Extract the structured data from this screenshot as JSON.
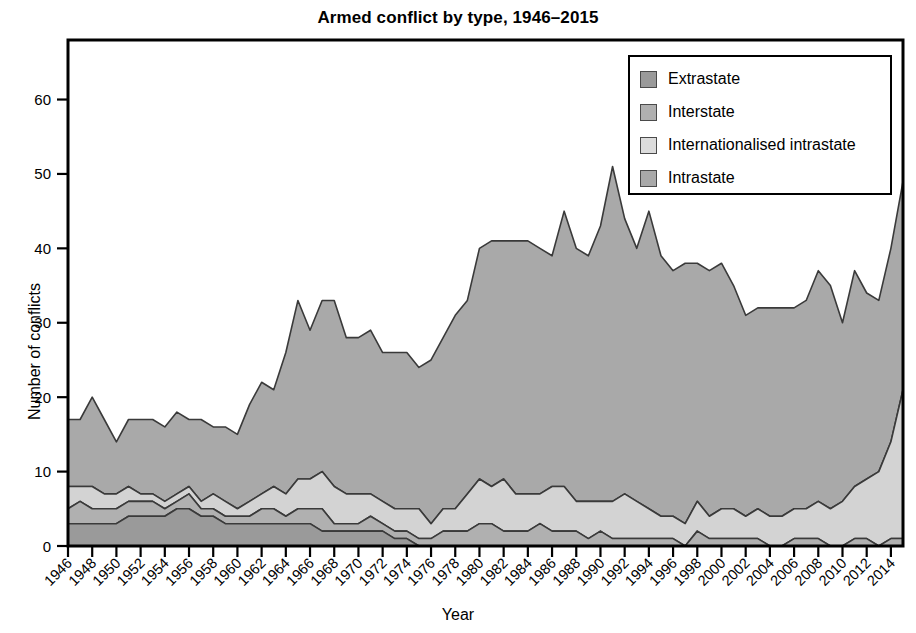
{
  "chart_data": {
    "type": "area",
    "stacked": true,
    "title": "Armed conflict by type, 1946–2015",
    "xlabel": "Year",
    "ylabel": "Number of conflicts",
    "xlim": [
      1946,
      2015
    ],
    "ylim": [
      0,
      68
    ],
    "yticks": [
      0,
      10,
      20,
      30,
      40,
      50,
      60
    ],
    "xticks": [
      1946,
      1948,
      1950,
      1952,
      1954,
      1956,
      1958,
      1960,
      1962,
      1964,
      1966,
      1968,
      1970,
      1972,
      1974,
      1976,
      1978,
      1980,
      1982,
      1984,
      1986,
      1988,
      1990,
      1992,
      1994,
      1996,
      1998,
      2000,
      2002,
      2004,
      2006,
      2008,
      2010,
      2012,
      2014
    ],
    "grid": false,
    "legend_position": "top-right",
    "x": [
      1946,
      1947,
      1948,
      1949,
      1950,
      1951,
      1952,
      1953,
      1954,
      1955,
      1956,
      1957,
      1958,
      1959,
      1960,
      1961,
      1962,
      1963,
      1964,
      1965,
      1966,
      1967,
      1968,
      1969,
      1970,
      1971,
      1972,
      1973,
      1974,
      1975,
      1976,
      1977,
      1978,
      1979,
      1980,
      1981,
      1982,
      1983,
      1984,
      1985,
      1986,
      1987,
      1988,
      1989,
      1990,
      1991,
      1992,
      1993,
      1994,
      1995,
      1996,
      1997,
      1998,
      1999,
      2000,
      2001,
      2002,
      2003,
      2004,
      2005,
      2006,
      2007,
      2008,
      2009,
      2010,
      2011,
      2012,
      2013,
      2014,
      2015
    ],
    "series": [
      {
        "name": "Extrastate",
        "color": "#9a9a9a",
        "values": [
          3,
          3,
          3,
          3,
          3,
          4,
          4,
          4,
          4,
          5,
          5,
          4,
          4,
          3,
          3,
          3,
          3,
          3,
          3,
          3,
          3,
          2,
          2,
          2,
          2,
          2,
          2,
          1,
          1,
          0,
          0,
          0,
          0,
          0,
          0,
          0,
          0,
          0,
          0,
          0,
          0,
          0,
          0,
          0,
          0,
          0,
          0,
          0,
          0,
          0,
          0,
          0,
          0,
          0,
          0,
          0,
          0,
          0,
          0,
          0,
          0,
          0,
          0,
          0,
          0,
          0,
          0,
          0,
          0,
          0
        ]
      },
      {
        "name": "Interstate",
        "color": "#b0b0b0",
        "values": [
          2,
          3,
          2,
          2,
          2,
          2,
          2,
          2,
          1,
          1,
          2,
          1,
          1,
          1,
          1,
          1,
          2,
          2,
          1,
          2,
          2,
          3,
          1,
          1,
          1,
          2,
          1,
          1,
          1,
          1,
          1,
          2,
          2,
          2,
          3,
          3,
          2,
          2,
          2,
          3,
          2,
          2,
          2,
          1,
          2,
          1,
          1,
          1,
          1,
          1,
          1,
          0,
          2,
          1,
          1,
          1,
          1,
          1,
          0,
          0,
          1,
          1,
          1,
          0,
          0,
          1,
          1,
          0,
          1,
          1
        ]
      },
      {
        "name": "Internationalised intrastate",
        "color": "#d3d3d3",
        "values": [
          3,
          2,
          3,
          2,
          2,
          2,
          1,
          1,
          1,
          1,
          1,
          1,
          2,
          2,
          1,
          2,
          2,
          3,
          3,
          4,
          4,
          5,
          5,
          4,
          4,
          3,
          3,
          3,
          3,
          4,
          2,
          3,
          3,
          5,
          6,
          5,
          7,
          5,
          5,
          4,
          6,
          6,
          4,
          5,
          4,
          5,
          6,
          5,
          4,
          3,
          3,
          3,
          4,
          3,
          4,
          4,
          3,
          4,
          4,
          4,
          4,
          4,
          5,
          5,
          6,
          7,
          8,
          10,
          13,
          20
        ]
      },
      {
        "name": "Intrastate",
        "color": "#a9a9a9",
        "values": [
          9,
          9,
          12,
          10,
          7,
          9,
          10,
          10,
          10,
          11,
          9,
          11,
          9,
          10,
          10,
          13,
          15,
          13,
          19,
          24,
          20,
          23,
          25,
          21,
          21,
          22,
          20,
          21,
          21,
          19,
          22,
          23,
          26,
          26,
          31,
          33,
          32,
          34,
          34,
          33,
          31,
          37,
          34,
          33,
          37,
          45,
          37,
          34,
          40,
          35,
          33,
          35,
          32,
          33,
          33,
          30,
          27,
          27,
          28,
          28,
          27,
          28,
          31,
          30,
          24,
          29,
          25,
          23,
          26,
          28
        ]
      }
    ],
    "totals": [
      17,
      17,
      20,
      17,
      14,
      17,
      17,
      17,
      16,
      18,
      17,
      17,
      16,
      16,
      15,
      19,
      22,
      21,
      26,
      33,
      29,
      33,
      33,
      28,
      28,
      29,
      26,
      26,
      26,
      24,
      25,
      28,
      31,
      33,
      40,
      41,
      41,
      41,
      41,
      40,
      39,
      45,
      40,
      39,
      43,
      51,
      44,
      40,
      45,
      39,
      37,
      38,
      38,
      37,
      38,
      35,
      31,
      32,
      32,
      32,
      32,
      33,
      37,
      35,
      30,
      37,
      34,
      33,
      40,
      49
    ]
  },
  "legend": {
    "items": [
      {
        "label": "Extrastate",
        "color": "#9a9a9a"
      },
      {
        "label": "Interstate",
        "color": "#b0b0b0"
      },
      {
        "label": "Internationalised intrastate",
        "color": "#dcdcdc"
      },
      {
        "label": "Intrastate",
        "color": "#a9a9a9"
      }
    ]
  }
}
